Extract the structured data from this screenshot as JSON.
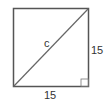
{
  "diagram": {
    "shape": "square",
    "labels": {
      "diagonal": "c",
      "right_side": "15",
      "bottom_side": "15"
    },
    "colors": {
      "stroke": "#555555",
      "text": "#333333",
      "background": "#ffffff"
    }
  }
}
